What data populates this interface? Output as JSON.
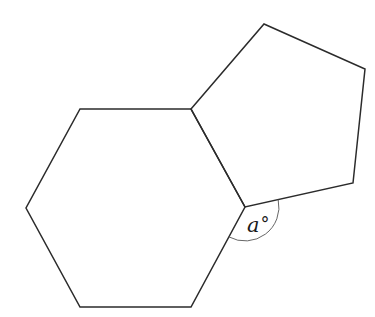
{
  "diagram": {
    "type": "geometry",
    "hexagon": {
      "sides": 6,
      "vertices": [
        [
          80,
          109
        ],
        [
          191,
          109
        ],
        [
          245,
          207
        ],
        [
          191,
          307
        ],
        [
          80,
          307
        ],
        [
          26,
          208
        ]
      ]
    },
    "pentagon": {
      "sides": 5,
      "vertices": [
        [
          191,
          109
        ],
        [
          264,
          24
        ],
        [
          365,
          69
        ],
        [
          353,
          183
        ],
        [
          245,
          207
        ]
      ]
    },
    "shared_edge": [
      [
        191,
        109
      ],
      [
        245,
        207
      ]
    ],
    "angle": {
      "vertex": [
        245,
        207
      ],
      "label_text": "a",
      "unit_symbol": "°",
      "arc_radius": 34
    }
  },
  "colors": {
    "stroke": "#2b2b2b",
    "arc": "#555555",
    "background": "#ffffff"
  }
}
